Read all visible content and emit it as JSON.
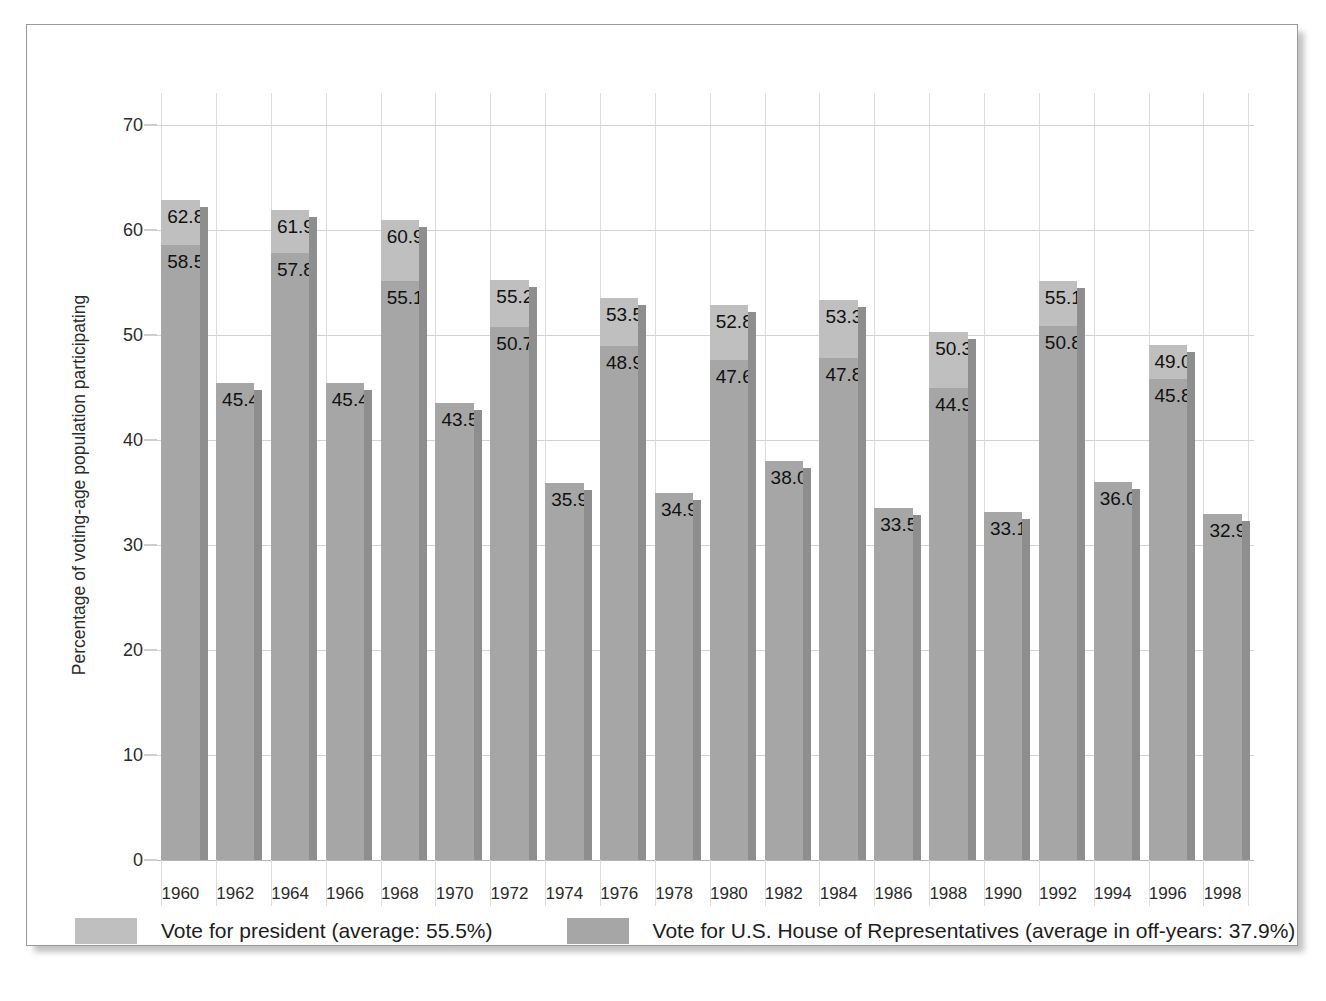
{
  "chart_data": {
    "type": "bar",
    "title": "",
    "subtitle": "",
    "xlabel": "",
    "ylabel": "Percentage of voting-age population participating",
    "ylim": [
      0,
      73
    ],
    "ytick_values": [
      0,
      10,
      20,
      30,
      40,
      50,
      60,
      70
    ],
    "ytick_labels": [
      "0",
      "10",
      "20",
      "30",
      "40",
      "50",
      "60",
      "70"
    ],
    "grid": true,
    "legend_position": "bottom",
    "categories": [
      "1960",
      "1962",
      "1964",
      "1966",
      "1968",
      "1970",
      "1972",
      "1974",
      "1976",
      "1978",
      "1980",
      "1982",
      "1984",
      "1986",
      "1988",
      "1990",
      "1992",
      "1994",
      "1996",
      "1998"
    ],
    "series": [
      {
        "name": "Vote for president (average: 55.5%)",
        "color": "#bfbfbf",
        "values": [
          62.8,
          null,
          61.9,
          null,
          60.9,
          null,
          55.2,
          null,
          53.5,
          null,
          52.8,
          null,
          53.3,
          null,
          50.3,
          null,
          55.1,
          null,
          49.0,
          null
        ]
      },
      {
        "name": "Vote for U.S. House of Representatives (average in off-years: 37.9%)",
        "color": "#a6a6a6",
        "values": [
          58.5,
          45.4,
          57.8,
          45.4,
          55.1,
          43.5,
          50.7,
          35.9,
          48.9,
          34.9,
          47.6,
          38.0,
          47.8,
          33.5,
          44.9,
          33.1,
          50.8,
          36.0,
          45.8,
          32.9
        ]
      }
    ],
    "bars": [
      {
        "year": "1960",
        "president": "62.8",
        "house": "58.5"
      },
      {
        "year": "1962",
        "president": null,
        "house": "45.4"
      },
      {
        "year": "1964",
        "president": "61.9",
        "house": "57.8"
      },
      {
        "year": "1966",
        "president": null,
        "house": "45.4"
      },
      {
        "year": "1968",
        "president": "60.9",
        "house": "55.1"
      },
      {
        "year": "1970",
        "president": null,
        "house": "43.5"
      },
      {
        "year": "1972",
        "president": "55.2",
        "house": "50.7"
      },
      {
        "year": "1974",
        "president": null,
        "house": "35.9"
      },
      {
        "year": "1976",
        "president": "53.5",
        "house": "48.9"
      },
      {
        "year": "1978",
        "president": null,
        "house": "34.9"
      },
      {
        "year": "1980",
        "president": "52.8",
        "house": "47.6"
      },
      {
        "year": "1982",
        "president": null,
        "house": "38.0"
      },
      {
        "year": "1984",
        "president": "53.3",
        "house": "47.8"
      },
      {
        "year": "1986",
        "president": null,
        "house": "33.5"
      },
      {
        "year": "1988",
        "president": "50.3",
        "house": "44.9"
      },
      {
        "year": "1990",
        "president": null,
        "house": "33.1"
      },
      {
        "year": "1992",
        "president": "55.1",
        "house": "50.8"
      },
      {
        "year": "1994",
        "president": null,
        "house": "36.0"
      },
      {
        "year": "1996",
        "president": "49.0",
        "house": "45.8"
      },
      {
        "year": "1998",
        "president": null,
        "house": "32.9"
      }
    ]
  },
  "legend": {
    "entries": [
      {
        "label": "Vote for president (average: 55.5%)",
        "color": "#bfbfbf"
      },
      {
        "label": "Vote for U.S. House of Representatives (average in off-years: 37.9%)",
        "color": "#a6a6a6"
      }
    ]
  },
  "colors": {
    "president": "#bfbfbf",
    "house": "#a6a6a6",
    "bar_shadow": "#8e8e8e",
    "grid": "#d2d2d2",
    "frame": "#9a9a9a",
    "text": "#1d1d1d",
    "background": "#ffffff"
  }
}
